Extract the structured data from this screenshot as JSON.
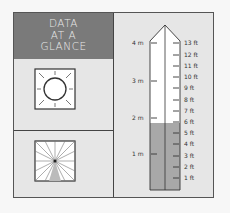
{
  "panel": {
    "title_lines": [
      "DATA",
      "AT A",
      "GLANCE"
    ],
    "icons": {
      "top": "sun-icon",
      "bottom": "compass-sector-icon"
    }
  },
  "gauge": {
    "metric_labels": [
      "4 m",
      "3 m",
      "2 m",
      "1 m"
    ],
    "feet_labels": [
      "13 ft",
      "12 ft",
      "11 ft",
      "10 ft",
      "9 ft",
      "8 ft",
      "7 ft",
      "6 ft",
      "5 ft",
      "4 ft",
      "3 ft",
      "2 ft",
      "1 ft"
    ],
    "fill_level_ft": 6,
    "colors": {
      "fill": "#a8a8a8",
      "empty": "#ffffff",
      "title_band": "#7a7a7a",
      "background": "#e6e6e6"
    }
  }
}
